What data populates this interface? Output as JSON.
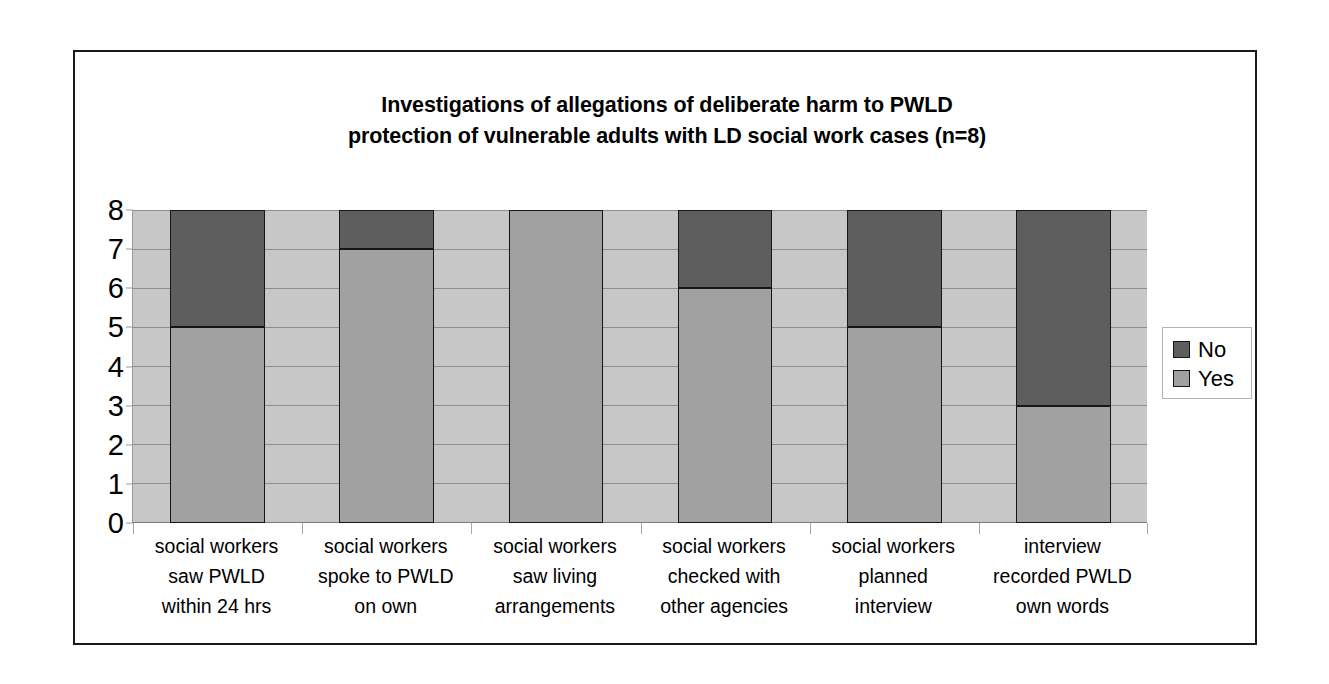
{
  "chart_data": {
    "type": "bar",
    "subtype": "stacked-column",
    "title": "Investigations of allegations of deliberate harm to PWLD protection of vulnerable adults with LD social work cases (n=8)",
    "title_lines": [
      "Investigations of allegations of deliberate harm to PWLD",
      "protection of vulnerable adults with LD social work cases (n=8)"
    ],
    "xlabel": "",
    "ylabel": "",
    "ylim": [
      0,
      8
    ],
    "yticks": [
      0,
      1,
      2,
      3,
      4,
      5,
      6,
      7,
      8
    ],
    "ytick_labels": [
      "0",
      "1",
      "2",
      "3",
      "4",
      "5",
      "6",
      "7",
      "8"
    ],
    "grid": true,
    "legend_position": "right",
    "categories": [
      "social workers saw PWLD within 24 hrs",
      "social workers spoke to PWLD on own",
      "social workers saw living arrangements",
      "social workers checked with other agencies",
      "social workers planned interview",
      "interview recorded PWLD own words"
    ],
    "category_lines": [
      [
        "social workers",
        "saw PWLD",
        "within 24 hrs"
      ],
      [
        "social workers",
        "spoke to PWLD",
        "on own"
      ],
      [
        "social workers",
        "saw living",
        "arrangements"
      ],
      [
        "social workers",
        "checked with",
        "other agencies"
      ],
      [
        "social workers",
        "planned",
        "interview"
      ],
      [
        "interview",
        "recorded PWLD",
        "own words"
      ]
    ],
    "series": [
      {
        "name": "Yes",
        "color": "#a1a1a1",
        "values": [
          5,
          7,
          8,
          6,
          5,
          3
        ]
      },
      {
        "name": "No",
        "color": "#5e5e5e",
        "values": [
          3,
          1,
          0,
          2,
          3,
          5
        ]
      }
    ],
    "stack_order_bottom_to_top": [
      "Yes",
      "No"
    ],
    "plot_background": "#c7c7c7",
    "border_color": "#161616"
  },
  "legend": {
    "items": [
      {
        "label": "No",
        "color": "#5e5e5e"
      },
      {
        "label": "Yes",
        "color": "#a1a1a1"
      }
    ]
  }
}
